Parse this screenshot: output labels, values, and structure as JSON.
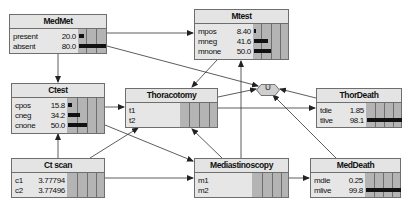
{
  "nodes": {
    "medmet": {
      "title": "MedMet",
      "states": [
        {
          "label": "present",
          "value": "20.0",
          "pct": 20.0
        },
        {
          "label": "absent",
          "value": "80.0",
          "pct": 80.0
        }
      ]
    },
    "mtest": {
      "title": "Mtest",
      "states": [
        {
          "label": "mpos",
          "value": "8.40",
          "pct": 8.4
        },
        {
          "label": "mneg",
          "value": "41.6",
          "pct": 41.6
        },
        {
          "label": "mnone",
          "value": "50.0",
          "pct": 50.0
        }
      ]
    },
    "ctest": {
      "title": "Ctest",
      "states": [
        {
          "label": "cpos",
          "value": "15.8",
          "pct": 15.8
        },
        {
          "label": "cneg",
          "value": "34.2",
          "pct": 34.2
        },
        {
          "label": "cnone",
          "value": "50.0",
          "pct": 50.0
        }
      ]
    },
    "thoracotomy": {
      "title": "Thoracotomy",
      "states": [
        {
          "label": "t1",
          "value": ""
        },
        {
          "label": "t2",
          "value": ""
        }
      ]
    },
    "thordeath": {
      "title": "ThorDeath",
      "states": [
        {
          "label": "tdie",
          "value": "1.85",
          "pct": 1.85
        },
        {
          "label": "tlive",
          "value": "98.1",
          "pct": 98.1
        }
      ]
    },
    "ctscan": {
      "title": "Ct scan",
      "states": [
        {
          "label": "c1",
          "value": "3.77794"
        },
        {
          "label": "c2",
          "value": "3.77496"
        }
      ]
    },
    "mediastinoscopy": {
      "title": "Mediastinoscopy",
      "states": [
        {
          "label": "m1",
          "value": ""
        },
        {
          "label": "m2",
          "value": ""
        }
      ]
    },
    "meddeath": {
      "title": "MedDeath",
      "states": [
        {
          "label": "mdie",
          "value": "0.25",
          "pct": 0.25
        },
        {
          "label": "mlive",
          "value": "99.8",
          "pct": 99.8
        }
      ]
    },
    "utility": {
      "title": "U"
    }
  },
  "colors": {
    "node_bg": "#e6e6e6",
    "bar_bg": "#b4b4b4",
    "bar_fill": "#111111",
    "border": "#6e6e6e"
  }
}
